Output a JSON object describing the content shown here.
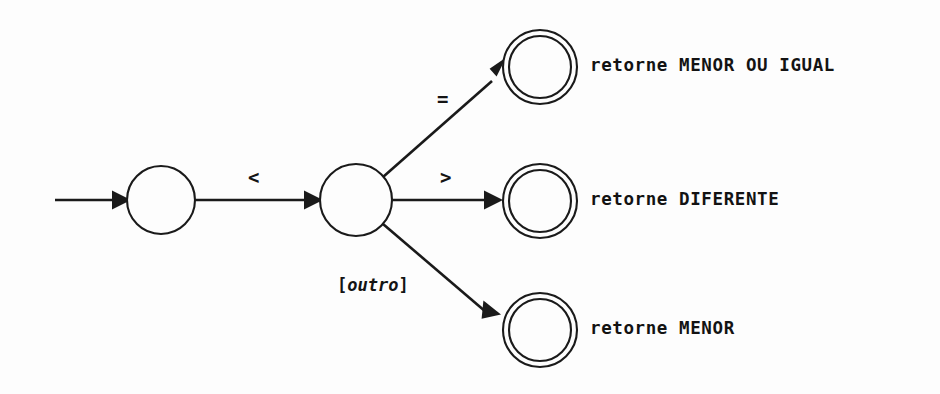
{
  "diagram": {
    "type": "finite-state-machine",
    "background_color": "#fdfdfd",
    "stroke_color": "#1a1a1a",
    "states": [
      {
        "id": "s0",
        "kind": "start",
        "accepting": false,
        "cx": 161,
        "cy": 200,
        "r": 34
      },
      {
        "id": "s1",
        "kind": "intermediate",
        "accepting": false,
        "cx": 356,
        "cy": 200,
        "r": 36
      },
      {
        "id": "s2",
        "kind": "final",
        "accepting": true,
        "cx": 540,
        "cy": 67,
        "r": 37,
        "r_inner": 31
      },
      {
        "id": "s3",
        "kind": "final",
        "accepting": true,
        "cx": 540,
        "cy": 201,
        "r": 37,
        "r_inner": 31
      },
      {
        "id": "s4",
        "kind": "final",
        "accepting": true,
        "cx": 540,
        "cy": 330,
        "r": 37,
        "r_inner": 31
      }
    ],
    "initial_arrow": {
      "from_x": 55,
      "to_x": 127,
      "y": 200
    },
    "transitions": [
      {
        "id": "t0",
        "from": "s0",
        "to": "s1",
        "label": "<",
        "label_x": 248,
        "label_y": 168
      },
      {
        "id": "t1",
        "from": "s1",
        "to": "s2",
        "label": "=",
        "label_x": 437,
        "label_y": 90
      },
      {
        "id": "t2",
        "from": "s1",
        "to": "s3",
        "label": ">",
        "label_x": 440,
        "label_y": 168
      },
      {
        "id": "t3",
        "from": "s1",
        "to": "s4",
        "label": "[outro]",
        "label_bracket_open": "[",
        "label_word": "outro",
        "label_bracket_close": "]",
        "label_x": 337,
        "label_y": 277
      }
    ],
    "actions": [
      {
        "id": "a1",
        "state": "s2",
        "text": "retorne MENOR OU IGUAL",
        "x": 590,
        "y": 57
      },
      {
        "id": "a2",
        "state": "s3",
        "text": "retorne DIFERENTE",
        "x": 590,
        "y": 191
      },
      {
        "id": "a3",
        "state": "s4",
        "text": "retorne MENOR",
        "x": 590,
        "y": 320
      }
    ]
  }
}
